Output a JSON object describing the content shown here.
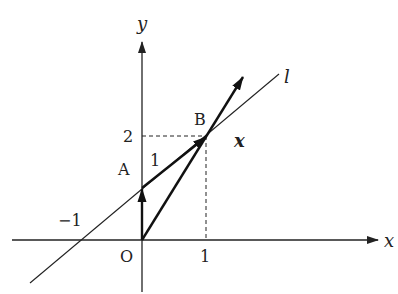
{
  "diagram": {
    "type": "coordinate-plane-vectors",
    "axes": {
      "x_label": "x",
      "y_label": "y",
      "origin_label": "O"
    },
    "ticks": {
      "x_neg_one": "−1",
      "x_one": "1",
      "y_two": "2"
    },
    "points": {
      "A": {
        "label": "A",
        "coords": [
          0,
          1
        ]
      },
      "B": {
        "label": "B",
        "coords": [
          1,
          2
        ]
      }
    },
    "line": {
      "label": "l",
      "through": [
        [
          -1,
          0
        ],
        [
          0,
          1
        ]
      ]
    },
    "vectors": [
      {
        "name": "OA",
        "from": [
          0,
          0
        ],
        "to": [
          0,
          1
        ]
      },
      {
        "name": "AB",
        "from": [
          0,
          1
        ],
        "to": [
          1,
          2
        ],
        "label": "1"
      },
      {
        "name": "x",
        "from": [
          0,
          0
        ],
        "to": [
          1.6,
          2.6
        ],
        "label": "x"
      }
    ],
    "guides": {
      "dashed_from_B_to_axes": true
    }
  }
}
